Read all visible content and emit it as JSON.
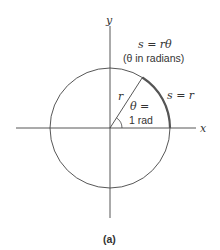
{
  "figure": {
    "axis_x_label": "x",
    "axis_y_label": "y",
    "formula": "s = rθ",
    "formula_note": "(θ in radians)",
    "arc_label": "s = r",
    "radius_label": "r",
    "angle_label_line1": "θ =",
    "angle_label_line2": "1 rad",
    "caption": "(a)"
  },
  "colors": {
    "line": "#444444",
    "arc_highlight": "#555555"
  }
}
